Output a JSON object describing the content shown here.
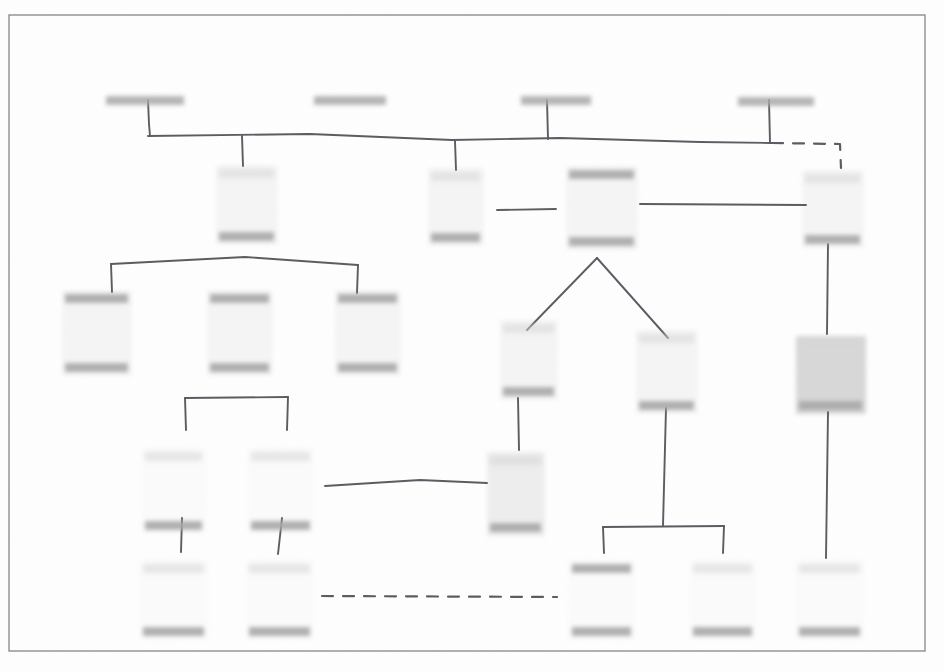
{
  "document": {
    "kind": "scanned-hierarchy-diagram",
    "title": "",
    "legibility": "illegible",
    "note": "All label text in this scan is degraded to unreadable gray smudges; no characters are resolvable at any zoom level.",
    "page_background": "#fefefe",
    "frame_color": "#8d8d8d",
    "ink_color": "#5c5c63",
    "box_fill_light": "#f4f4f4",
    "box_fill_mid": "#ededed",
    "box_fill_dark": "#d7d7d7",
    "text_band_color": "#a9a9a9",
    "text_band_color_faint": "#d5d5d5"
  },
  "frame": {
    "x": 9,
    "y": 15,
    "w": 916,
    "h": 636
  },
  "nodes": [
    {
      "id": "t1",
      "label": "",
      "x": 106,
      "y": 96,
      "w": 78,
      "h": 9,
      "kind": "label-only",
      "band": "strong"
    },
    {
      "id": "t2",
      "label": "",
      "x": 314,
      "y": 96,
      "w": 72,
      "h": 9,
      "kind": "label-only",
      "band": "strong"
    },
    {
      "id": "t3",
      "label": "",
      "x": 521,
      "y": 96,
      "w": 70,
      "h": 9,
      "kind": "label-only",
      "band": "strong"
    },
    {
      "id": "t4",
      "label": "",
      "x": 738,
      "y": 97,
      "w": 76,
      "h": 9,
      "kind": "label-only",
      "band": "strong"
    },
    {
      "id": "m1",
      "label": "",
      "x": 216,
      "y": 165,
      "w": 62,
      "h": 80,
      "kind": "box",
      "fill": "light",
      "band_top": "faint",
      "band_bottom": "strong"
    },
    {
      "id": "m2",
      "label": "",
      "x": 428,
      "y": 168,
      "w": 56,
      "h": 78,
      "kind": "box",
      "fill": "light",
      "band_top": "faint",
      "band_bottom": "strong"
    },
    {
      "id": "m3",
      "label": "",
      "x": 566,
      "y": 166,
      "w": 72,
      "h": 84,
      "kind": "box",
      "fill": "light",
      "band_top": "strong",
      "band_bottom": "strong"
    },
    {
      "id": "m4",
      "label": "",
      "x": 802,
      "y": 170,
      "w": 62,
      "h": 78,
      "kind": "box",
      "fill": "light",
      "band_top": "faint",
      "band_bottom": "strong"
    },
    {
      "id": "l1",
      "label": "",
      "x": 62,
      "y": 290,
      "w": 70,
      "h": 86,
      "kind": "box",
      "fill": "light",
      "band_top": "strong",
      "band_bottom": "strong"
    },
    {
      "id": "l2",
      "label": "",
      "x": 207,
      "y": 290,
      "w": 66,
      "h": 86,
      "kind": "box",
      "fill": "light",
      "band_top": "strong",
      "band_bottom": "strong"
    },
    {
      "id": "l3",
      "label": "",
      "x": 335,
      "y": 290,
      "w": 66,
      "h": 86,
      "kind": "box",
      "fill": "light",
      "band_top": "strong",
      "band_bottom": "strong"
    },
    {
      "id": "c1",
      "label": "",
      "x": 500,
      "y": 320,
      "w": 58,
      "h": 80,
      "kind": "box",
      "fill": "light",
      "band_top": "faint",
      "band_bottom": "strong"
    },
    {
      "id": "c2",
      "label": "",
      "x": 636,
      "y": 330,
      "w": 62,
      "h": 84,
      "kind": "box",
      "fill": "light",
      "band_top": "faint",
      "band_bottom": "strong"
    },
    {
      "id": "r1",
      "label": "",
      "x": 796,
      "y": 336,
      "w": 70,
      "h": 78,
      "kind": "box",
      "fill": "dark",
      "band_top": "faint",
      "band_bottom": "strong"
    },
    {
      "id": "b1",
      "label": "",
      "x": 142,
      "y": 448,
      "w": 64,
      "h": 86,
      "kind": "box",
      "fill": "faint",
      "band_top": "faint",
      "band_bottom": "strong"
    },
    {
      "id": "b2",
      "label": "",
      "x": 248,
      "y": 448,
      "w": 66,
      "h": 86,
      "kind": "box",
      "fill": "faint",
      "band_top": "faint",
      "band_bottom": "strong"
    },
    {
      "id": "c3",
      "label": "",
      "x": 487,
      "y": 452,
      "w": 58,
      "h": 84,
      "kind": "box",
      "fill": "mid",
      "band_top": "faint",
      "band_bottom": "strong"
    },
    {
      "id": "b3",
      "label": "",
      "x": 140,
      "y": 560,
      "w": 68,
      "h": 80,
      "kind": "box",
      "fill": "faint",
      "band_top": "faint",
      "band_bottom": "strong"
    },
    {
      "id": "b4",
      "label": "",
      "x": 246,
      "y": 560,
      "w": 68,
      "h": 80,
      "kind": "box",
      "fill": "faint",
      "band_top": "faint",
      "band_bottom": "strong"
    },
    {
      "id": "b5",
      "label": "",
      "x": 569,
      "y": 560,
      "w": 66,
      "h": 80,
      "kind": "box",
      "fill": "faint",
      "band_top": "strong",
      "band_bottom": "strong"
    },
    {
      "id": "b6",
      "label": "",
      "x": 690,
      "y": 560,
      "w": 66,
      "h": 80,
      "kind": "box",
      "fill": "faint",
      "band_top": "faint",
      "band_bottom": "strong"
    },
    {
      "id": "b7",
      "label": "",
      "x": 796,
      "y": 560,
      "w": 68,
      "h": 80,
      "kind": "box",
      "fill": "faint",
      "band_top": "faint",
      "band_bottom": "strong"
    }
  ],
  "connectors": [
    {
      "id": "bus",
      "style": "solid",
      "kind": "horizontal-bus",
      "path": "M 148 136 L 310 134 L 452 140 L 560 138 L 700 142 L 772 143"
    },
    {
      "id": "stem-t1",
      "style": "solid",
      "kind": "drop-stem",
      "path": "M 148 100 L 149 124 L 150 136"
    },
    {
      "id": "stem-t2",
      "style": "solid",
      "kind": "drop-stem",
      "path": "M 345 100 L 345 140"
    },
    {
      "id": "stem-t3",
      "style": "solid",
      "kind": "drop-stem",
      "path": "M 547 100 L 548 139"
    },
    {
      "id": "stem-t4",
      "style": "solid",
      "kind": "drop-stem",
      "path": "M 769 100 L 770 143"
    },
    {
      "id": "bus-to-m1",
      "style": "solid",
      "kind": "drop-stem",
      "path": "M 242 136 L 243 166"
    },
    {
      "id": "bus-to-m2",
      "style": "solid",
      "kind": "drop-stem",
      "path": "M 455 141 L 456 170"
    },
    {
      "id": "dash-right",
      "style": "dashed",
      "kind": "elbow",
      "path": "M 772 143 L 840 144 L 841 168"
    },
    {
      "id": "m1-bar",
      "style": "solid",
      "kind": "bracket",
      "path": "M 111 264 L 245 257 L 358 265"
    },
    {
      "id": "m1-stem",
      "style": "solid",
      "kind": "drop-stem",
      "path": "M 245 242 L 245 290"
    },
    {
      "id": "m1-leg-l",
      "style": "solid",
      "kind": "drop-stem",
      "path": "M 111 264 L 112 292"
    },
    {
      "id": "m1-leg-r",
      "style": "solid",
      "kind": "drop-stem",
      "path": "M 358 265 L 357 293"
    },
    {
      "id": "l2-stem",
      "style": "solid",
      "kind": "drop-stem",
      "path": "M 238 372 L 238 398"
    },
    {
      "id": "l2-bar",
      "style": "solid",
      "kind": "bracket",
      "path": "M 185 398 L 288 397"
    },
    {
      "id": "l2-leg-l",
      "style": "solid",
      "kind": "drop-stem",
      "path": "M 185 398 L 186 430"
    },
    {
      "id": "l2-leg-r",
      "style": "solid",
      "kind": "drop-stem",
      "path": "M 288 397 L 287 430"
    },
    {
      "id": "b1-stem",
      "style": "solid",
      "kind": "drop-stem",
      "path": "M 182 518 L 181 552"
    },
    {
      "id": "b2-stem",
      "style": "solid",
      "kind": "drop-stem",
      "path": "M 282 518 L 278 554"
    },
    {
      "id": "m3-stem",
      "style": "solid",
      "kind": "drop-stem",
      "path": "M 597 240 L 597 258"
    },
    {
      "id": "m3-v-left",
      "style": "solid",
      "kind": "diagonal",
      "path": "M 597 258 L 527 330"
    },
    {
      "id": "m3-v-right",
      "style": "solid",
      "kind": "diagonal",
      "path": "M 597 258 L 668 338"
    },
    {
      "id": "rule-short",
      "style": "solid",
      "kind": "rule",
      "path": "M 497 210 L 556 209"
    },
    {
      "id": "rule-long",
      "style": "solid",
      "kind": "rule",
      "path": "M 640 204 L 806 205"
    },
    {
      "id": "rule-curve",
      "style": "solid",
      "kind": "rule",
      "path": "M 325 486 L 420 480 L 487 483"
    },
    {
      "id": "dash-bottom",
      "style": "dashed",
      "kind": "rule",
      "path": "M 322 596 L 557 597"
    },
    {
      "id": "c1-stem",
      "style": "solid",
      "kind": "drop-stem",
      "path": "M 518 398 L 519 450"
    },
    {
      "id": "c2-stem",
      "style": "solid",
      "kind": "drop-stem",
      "path": "M 666 408 L 663 526"
    },
    {
      "id": "c2-bar",
      "style": "solid",
      "kind": "bracket",
      "path": "M 603 527 L 724 526"
    },
    {
      "id": "c2-leg-l",
      "style": "solid",
      "kind": "drop-stem",
      "path": "M 603 527 L 604 553"
    },
    {
      "id": "c2-leg-r",
      "style": "solid",
      "kind": "drop-stem",
      "path": "M 724 526 L 723 553"
    },
    {
      "id": "m4-stem",
      "style": "solid",
      "kind": "drop-stem",
      "path": "M 828 244 L 827 334"
    },
    {
      "id": "r1-stem",
      "style": "solid",
      "kind": "drop-stem",
      "path": "M 828 412 L 826 558"
    }
  ]
}
